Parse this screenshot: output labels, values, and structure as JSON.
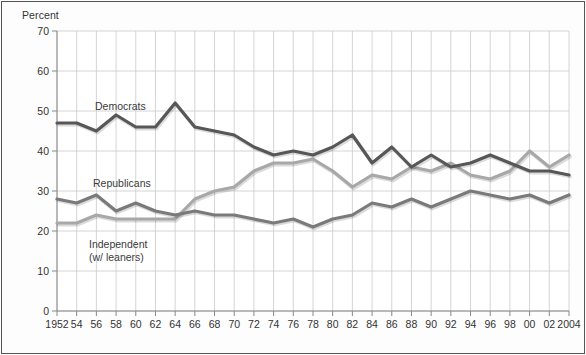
{
  "chart_data": {
    "type": "line",
    "title": "",
    "subtitle": "",
    "xlabel": "",
    "ylabel": "Percent",
    "ylim": [
      0,
      70
    ],
    "ytick_step": 10,
    "yticks": [
      0,
      10,
      20,
      30,
      40,
      50,
      60,
      70
    ],
    "xlim": [
      1952,
      2004
    ],
    "xtick_step": 2,
    "grid": true,
    "grid_x": true,
    "grid_y": true,
    "legend_position": "inline-annotations",
    "x": [
      1952,
      1954,
      1956,
      1958,
      1960,
      1962,
      1964,
      1966,
      1968,
      1970,
      1972,
      1974,
      1976,
      1978,
      1980,
      1982,
      1984,
      1986,
      1988,
      1990,
      1992,
      1994,
      1996,
      1998,
      2000,
      2002,
      2004
    ],
    "xtick_labels": [
      "1952",
      "54",
      "56",
      "58",
      "60",
      "62",
      "64",
      "66",
      "68",
      "70",
      "72",
      "74",
      "76",
      "78",
      "80",
      "82",
      "84",
      "86",
      "88",
      "90",
      "92",
      "94",
      "96",
      "98",
      "00",
      "02",
      "2004"
    ],
    "series": [
      {
        "name": "Democrats",
        "color": "#575757",
        "values": [
          47,
          47,
          45,
          49,
          46,
          46,
          52,
          46,
          45,
          44,
          41,
          39,
          40,
          39,
          41,
          44,
          37,
          41,
          36,
          39,
          36,
          37,
          39,
          37,
          35,
          35,
          34
        ]
      },
      {
        "name": "Republicans",
        "color": "#7a7a7a",
        "values": [
          28,
          27,
          29,
          25,
          27,
          25,
          24,
          25,
          24,
          24,
          23,
          22,
          23,
          21,
          23,
          24,
          27,
          26,
          28,
          26,
          28,
          30,
          29,
          28,
          29,
          27,
          29
        ]
      },
      {
        "name": "Independent (w/ leaners)",
        "color": "#a8a8a8",
        "values": [
          22,
          22,
          24,
          23,
          23,
          23,
          23,
          28,
          30,
          31,
          35,
          37,
          37,
          38,
          35,
          31,
          34,
          33,
          36,
          35,
          37,
          34,
          33,
          35,
          40,
          36,
          39
        ]
      }
    ],
    "annotations": [
      {
        "text": "Democrats",
        "x": 1960,
        "y": 50
      },
      {
        "text": "Republicans",
        "x": 1960,
        "y": 34
      },
      {
        "text": "Independent",
        "x": 1961,
        "y": 17
      },
      {
        "text": "(w/ leaners)",
        "x": 1961,
        "y": 14
      }
    ]
  },
  "labels": {
    "y_axis_title": "Percent",
    "democrats": "Democrats",
    "republicans": "Republicans",
    "independent_line1": "Independent",
    "independent_line2": "(w/ leaners)"
  },
  "colors": {
    "democrats": "#575757",
    "republicans": "#7a7a7a",
    "independent": "#a8a8a8",
    "grid": "#c9c9c9",
    "axis": "#888888",
    "text": "#333333",
    "background": "#fdfdfd"
  }
}
